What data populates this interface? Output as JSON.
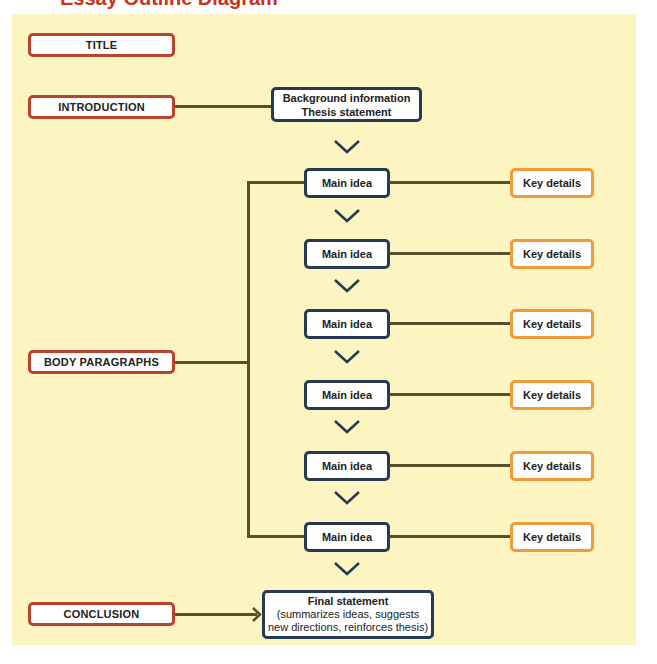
{
  "header": {
    "cut_title": "Essay Outline Diagram"
  },
  "diagram": {
    "sections": {
      "title": "TITLE",
      "introduction": "INTRODUCTION",
      "body": "BODY PARAGRAPHS",
      "conclusion": "CONCLUSION"
    },
    "intro_box": {
      "line1": "Background information",
      "line2": "Thesis statement"
    },
    "main_ideas": [
      "Main idea",
      "Main idea",
      "Main idea",
      "Main idea",
      "Main idea",
      "Main idea"
    ],
    "key_details": [
      "Key details",
      "Key details",
      "Key details",
      "Key details",
      "Key details",
      "Key details"
    ],
    "final_box": {
      "line1": "Final statement",
      "line2": "(summarizes ideas, suggests",
      "line3": "new directions, reinforces thesis)"
    },
    "icons": {
      "flow": "chevron-down-icon",
      "conclusion_arrow": "arrow-right-icon"
    },
    "colors": {
      "panel": "#fcf5c2",
      "section_border": "#b9432c",
      "content_border": "#263a52",
      "detail_border": "#ef9b3a",
      "connector": "#5a4d2b",
      "title_text": "#c8321e"
    }
  }
}
